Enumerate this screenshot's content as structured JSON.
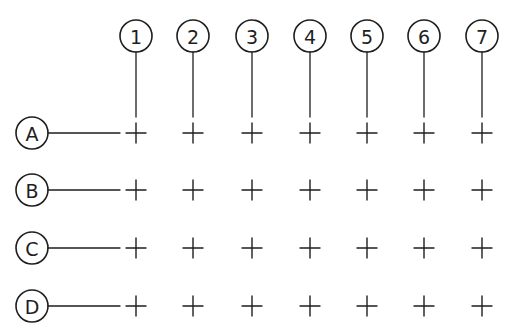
{
  "diagram": {
    "type": "structural-grid",
    "ink_color": "#1e1e1e",
    "background": "#ffffff",
    "columns": [
      {
        "label": "1",
        "x": 136
      },
      {
        "label": "2",
        "x": 193
      },
      {
        "label": "3",
        "x": 252
      },
      {
        "label": "4",
        "x": 310
      },
      {
        "label": "5",
        "x": 367
      },
      {
        "label": "6",
        "x": 424
      },
      {
        "label": "7",
        "x": 482
      }
    ],
    "rows": [
      {
        "label": "A",
        "y": 133
      },
      {
        "label": "B",
        "y": 190
      },
      {
        "label": "C",
        "y": 248
      },
      {
        "label": "D",
        "y": 306
      }
    ],
    "column_bubble_y": 36,
    "row_bubble_x": 32,
    "bubble_radius": 16,
    "cross_half_size": 10
  }
}
